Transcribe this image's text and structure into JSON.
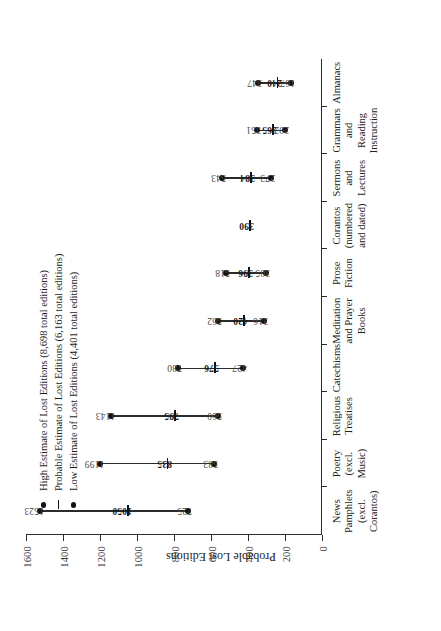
{
  "chart_data": {
    "type": "range",
    "title": "",
    "xlabel": "",
    "ylabel": "Probable Lost Editions",
    "ylim": [
      0,
      1600
    ],
    "yticks": [
      "0",
      "200",
      "400",
      "600",
      "800",
      "1000",
      "1200",
      "1400",
      "1600"
    ],
    "grid": false,
    "legend_position": "top-left",
    "categories": [
      "News\nPamphlets\n(excl.\nCorantos)",
      "Poetry\n(excl.\nMusic)",
      "Religious\nTreatises",
      "Catechisms",
      "Meditation\nand Prayer\nBooks",
      "Prose\nFiction",
      "Corantos\n(numbered\nand dated)",
      "Sermons\nand\nLectures",
      "Grammars\nand\nReading\nInstruction",
      "Almanacs"
    ],
    "series": [
      {
        "name": "High Estimate of Lost Editions (8,698 total editions)",
        "marker": "dot",
        "values": [
          1523,
          1199,
          1143,
          780,
          562,
          518,
          null,
          543,
          351,
          347
        ]
      },
      {
        "name": "Probable Estimate of Lost Editions (6,163 total editions)",
        "marker": "dash",
        "values": [
          1050,
          835,
          795,
          576,
          420,
          396,
          390,
          384,
          265,
          240
        ]
      },
      {
        "name": "Low Estimate of Lost Editions (4,401 total editions)",
        "marker": "dot",
        "values": [
          725,
          583,
          560,
          427,
          316,
          305,
          null,
          273,
          202,
          167
        ]
      }
    ],
    "point_labels": [
      {
        "high": "1523",
        "mid": "1050",
        "low": "725"
      },
      {
        "high": "1199",
        "mid": "835",
        "low": "583"
      },
      {
        "high": "1143",
        "mid": "795",
        "low": "560"
      },
      {
        "high": "780",
        "mid": "576",
        "low": "427"
      },
      {
        "high": "562",
        "mid": "420",
        "low": "316"
      },
      {
        "high": "518",
        "mid": "396",
        "low": "305"
      },
      {
        "high": "",
        "mid": "390",
        "low": ""
      },
      {
        "high": "543",
        "mid": "384",
        "low": "273"
      },
      {
        "high": "351",
        "mid": "265",
        "low": "202"
      },
      {
        "high": "347",
        "mid": "240",
        "low": "167"
      }
    ]
  },
  "legend": {
    "items": [
      {
        "marker": "dot",
        "label": "High Estimate of Lost Editions (8,698 total editions)"
      },
      {
        "marker": "dash",
        "label": "Probable Estimate of Lost Editions (6,163 total editions)"
      },
      {
        "marker": "dot",
        "label": "Low Estimate of Lost Editions (4,401 total editions)"
      }
    ]
  },
  "axis": {
    "y_title": "Probable Lost Editions"
  }
}
